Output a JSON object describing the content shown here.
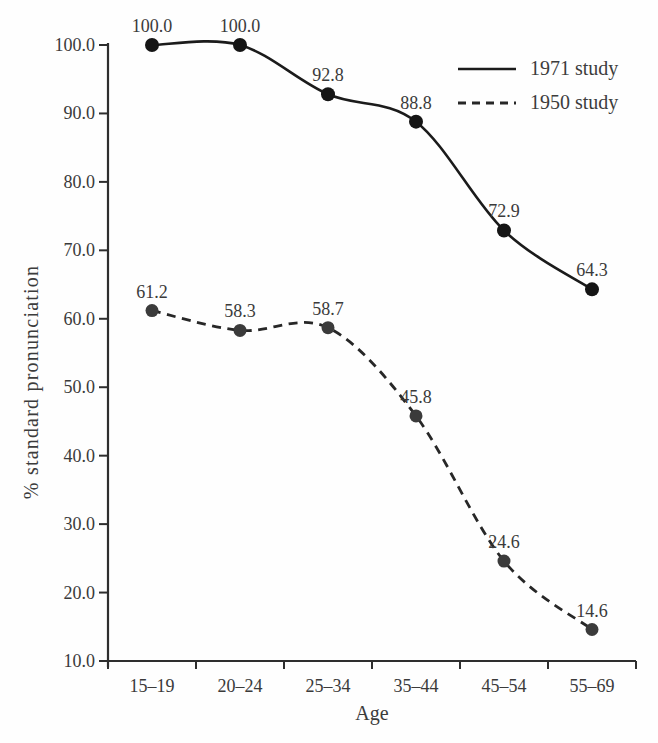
{
  "chart_data": {
    "type": "line",
    "title": "",
    "xlabel": "Age",
    "ylabel": "% standard pronunciation",
    "categories": [
      "15–19",
      "20–24",
      "25–34",
      "35–44",
      "45–54",
      "55–69"
    ],
    "series": [
      {
        "name": "1971 study",
        "style": "solid",
        "line_color": "#1b1b1b",
        "marker_color": "#151515",
        "values": [
          100.0,
          100.0,
          92.8,
          88.8,
          72.9,
          64.3
        ]
      },
      {
        "name": "1950 study",
        "style": "dashed",
        "line_color": "#272727",
        "marker_color": "#3b3b3b",
        "values": [
          61.2,
          58.3,
          58.7,
          45.8,
          24.6,
          14.6
        ]
      }
    ],
    "point_labels": [
      [
        "100.0",
        "100.0",
        "92.8",
        "88.8",
        "72.9",
        "64.3"
      ],
      [
        "61.2",
        "58.3",
        "58.7",
        "45.8",
        "24.6",
        "14.6"
      ]
    ],
    "yticks": [
      "100.0",
      "90.0",
      "80.0",
      "70.0",
      "60.0",
      "50.0",
      "40.0",
      "30.0",
      "20.0",
      "10.0"
    ],
    "ylim": [
      10,
      100
    ],
    "grid": false,
    "legend_position": "top-right",
    "axis_color": "#2e2e2e",
    "text_color": "#3a3a3a",
    "background": "#fefefe"
  }
}
